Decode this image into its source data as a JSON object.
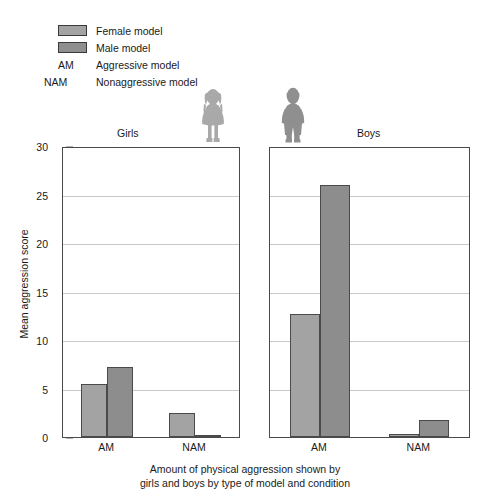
{
  "legend": {
    "items": [
      {
        "kind": "swatch",
        "key": "female",
        "label": "Female model",
        "color": "#a3a3a3"
      },
      {
        "kind": "swatch",
        "key": "male",
        "label": "Male model",
        "color": "#8f8f8f"
      },
      {
        "kind": "abbr",
        "abbr": "AM",
        "label": "Aggressive model"
      },
      {
        "kind": "abbr",
        "abbr": "NAM",
        "label": "Nonaggressive model"
      }
    ]
  },
  "panels": [
    {
      "id": "girls",
      "title": "Girls",
      "figure": "girl-silhouette-icon"
    },
    {
      "id": "boys",
      "title": "Boys",
      "figure": "boy-silhouette-icon"
    }
  ],
  "caption": {
    "line1": "Amount of physical aggression shown by",
    "line2": "girls and boys by type of model and condition"
  },
  "chart_data": {
    "type": "bar",
    "title": "",
    "xlabel": "Amount of physical aggression shown by girls and boys by type of model and condition",
    "ylabel": "Mean aggression score",
    "ylim": [
      0,
      30
    ],
    "yticks": [
      0,
      5,
      10,
      15,
      20,
      25,
      30
    ],
    "ytick_labels": [
      "0",
      "5",
      "10",
      "15",
      "20",
      "25",
      "30"
    ],
    "grid": true,
    "legend_position": "top-left",
    "panels": [
      {
        "name": "Girls",
        "categories": [
          "AM",
          "NAM"
        ],
        "series": [
          {
            "name": "Female model",
            "color": "#a3a3a3",
            "values": [
              5.5,
              2.5
            ]
          },
          {
            "name": "Male model",
            "color": "#8d8d8d",
            "values": [
              7.2,
              0.1
            ]
          }
        ]
      },
      {
        "name": "Boys",
        "categories": [
          "AM",
          "NAM"
        ],
        "series": [
          {
            "name": "Female model",
            "color": "#a3a3a3",
            "values": [
              12.7,
              0.3
            ]
          },
          {
            "name": "Male model",
            "color": "#8d8d8d",
            "values": [
              26.0,
              1.8
            ]
          }
        ]
      }
    ]
  }
}
